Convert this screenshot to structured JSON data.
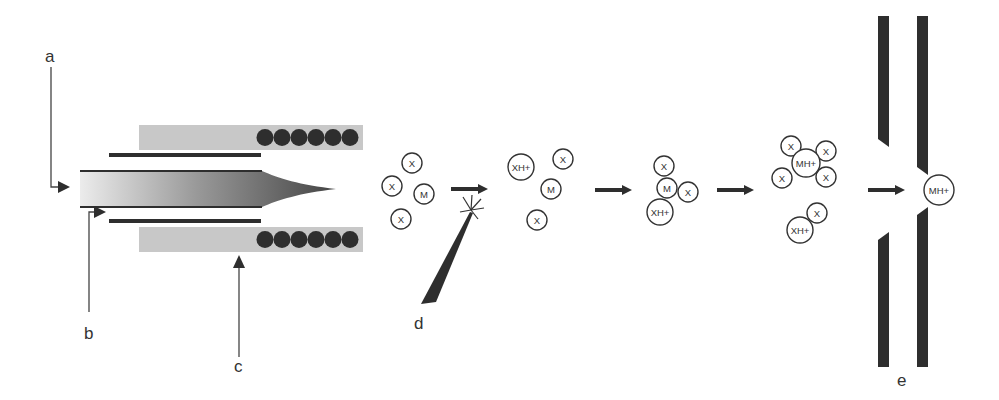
{
  "diagram": {
    "labels": {
      "a": "a",
      "b": "b",
      "c": "c",
      "d": "d",
      "e": "e"
    },
    "molecules": {
      "x": "X",
      "m": "M",
      "xh": "XH+",
      "mh": "MH+"
    },
    "stages": [
      {
        "name": "neutral-droplet",
        "contents": [
          "X",
          "X",
          "M",
          "X"
        ]
      },
      {
        "name": "ionized-droplet",
        "contents": [
          "XH+",
          "X",
          "M",
          "X"
        ]
      },
      {
        "name": "proton-transfer-cluster",
        "contents": [
          "X",
          "M",
          "X",
          "XH+"
        ]
      },
      {
        "name": "analyte-ion-cluster",
        "contents": [
          "X",
          "MH+",
          "X",
          "X",
          "X",
          "X",
          "XH+"
        ]
      },
      {
        "name": "analyte-ion-entering-orifice",
        "contents": [
          "MH+"
        ]
      }
    ],
    "colors": {
      "dark": "#2e2e2e",
      "heater_block": "#c8c8c8",
      "tube_light": "#e6e6e6",
      "tube_dark": "#4a4a4a"
    }
  }
}
